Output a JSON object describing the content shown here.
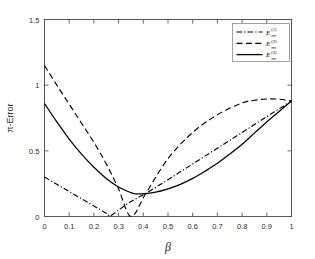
{
  "chart_data": {
    "type": "line",
    "title": "",
    "xlabel": "β",
    "ylabel": "π-Error",
    "xlim": [
      0,
      1
    ],
    "ylim": [
      0,
      1.5
    ],
    "grid": false,
    "legend_position": "top-right",
    "xticks": [
      "0",
      "0.1",
      "0.2",
      "0.3",
      "0.4",
      "0.5",
      "0.6",
      "0.7",
      "0.8",
      "0.9",
      "1"
    ],
    "xtick_values": [
      0,
      0.1,
      0.2,
      0.3,
      0.4,
      0.5,
      0.6,
      0.7,
      0.8,
      0.9,
      1
    ],
    "yticks": [
      "0",
      "0.5",
      "1",
      "1.5"
    ],
    "ytick_values": [
      0,
      0.5,
      1,
      1.5
    ],
    "series": [
      {
        "name": "E_pi^(1)",
        "label_base": "E",
        "label_sup": "(1)",
        "label_sub": "ππ",
        "style": "dash-dot",
        "color": "#000000",
        "x": [
          0,
          0.05,
          0.1,
          0.15,
          0.2,
          0.25,
          0.265,
          0.3,
          0.35,
          0.41,
          0.5,
          0.6,
          0.7,
          0.8,
          0.9,
          1
        ],
        "y": [
          0.3,
          0.245,
          0.19,
          0.135,
          0.08,
          0.025,
          0.0,
          0.05,
          0.115,
          0.175,
          0.28,
          0.4,
          0.52,
          0.64,
          0.76,
          0.88
        ]
      },
      {
        "name": "E_pi^(2)",
        "label_base": "E",
        "label_sup": "(2)",
        "label_sub": "ππ",
        "style": "dashed",
        "color": "#000000",
        "x": [
          0,
          0.05,
          0.1,
          0.15,
          0.2,
          0.25,
          0.3,
          0.35,
          0.41,
          0.5,
          0.6,
          0.7,
          0.8,
          0.85,
          0.9,
          0.95,
          1
        ],
        "y": [
          1.15,
          1.0,
          0.855,
          0.71,
          0.565,
          0.4,
          0.21,
          0.0,
          0.175,
          0.44,
          0.64,
          0.775,
          0.865,
          0.885,
          0.895,
          0.893,
          0.88
        ]
      },
      {
        "name": "E_pi^(3)",
        "label_base": "E",
        "label_sup": "(3)",
        "label_sub": "ππ",
        "style": "solid",
        "color": "#000000",
        "x": [
          0,
          0.05,
          0.1,
          0.15,
          0.2,
          0.25,
          0.3,
          0.35,
          0.37,
          0.41,
          0.45,
          0.5,
          0.55,
          0.6,
          0.65,
          0.7,
          0.75,
          0.8,
          0.85,
          0.9,
          0.95,
          1
        ],
        "y": [
          0.86,
          0.72,
          0.59,
          0.475,
          0.375,
          0.29,
          0.225,
          0.182,
          0.172,
          0.175,
          0.185,
          0.21,
          0.245,
          0.29,
          0.345,
          0.405,
          0.475,
          0.55,
          0.635,
          0.72,
          0.8,
          0.88
        ]
      }
    ]
  },
  "axes": {
    "x_title": "β",
    "y_title": "π-Error"
  },
  "legend": {
    "entries": [
      {
        "base": "E",
        "sup": "(1)",
        "sub": "ππ",
        "style": "dash-dot"
      },
      {
        "base": "E",
        "sup": "(2)",
        "sub": "ππ",
        "style": "dashed"
      },
      {
        "base": "E",
        "sup": "(3)",
        "sub": "ππ",
        "style": "solid"
      }
    ]
  },
  "colors": {
    "line": "#000000",
    "axis": "#555555",
    "text": "#2b2b2b",
    "background": "#ffffff",
    "legend_border": "#8a8a8a"
  }
}
